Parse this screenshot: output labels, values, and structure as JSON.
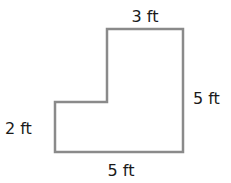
{
  "diagram": {
    "type": "L-shaped polygon",
    "stroke_color": "#8a8a8a",
    "labels": {
      "top": "3 ft",
      "right": "5 ft",
      "left": "2 ft",
      "bottom": "5 ft"
    }
  }
}
